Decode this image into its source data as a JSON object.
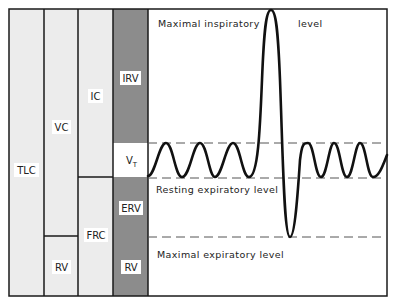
{
  "diagram": {
    "columns": [
      {
        "id": "tlc",
        "segments": [
          {
            "label": "TLC"
          }
        ]
      },
      {
        "id": "vc-rv",
        "segments": [
          {
            "label": "VC"
          },
          {
            "label": "RV"
          }
        ]
      },
      {
        "id": "ic-frc",
        "segments": [
          {
            "label": "IC"
          },
          {
            "label": "FRC"
          }
        ]
      },
      {
        "id": "volumes",
        "segments": [
          {
            "label": "IRV"
          },
          {
            "label": "V",
            "subscript": "T"
          },
          {
            "label": "ERV"
          },
          {
            "label": "RV"
          }
        ]
      }
    ],
    "levels": {
      "max_inspiratory_left": "Maximal inspiratory",
      "max_inspiratory_right": "level",
      "resting_expiratory": "Resting expiratory level",
      "max_expiratory": "Maximal expiratory level"
    },
    "colors": {
      "light_fill": "#ececec",
      "dark_fill": "#8c8c8c",
      "line": "#1a1a1a",
      "dash": "#555555"
    }
  }
}
